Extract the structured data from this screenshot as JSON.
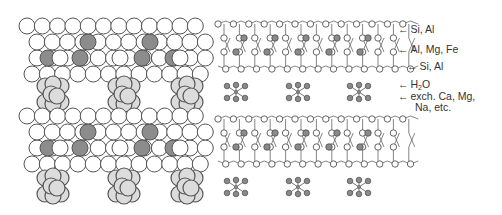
{
  "diagram": {
    "colors": {
      "outline": "#555555",
      "white_atom": "#ffffff",
      "dark_atom": "#8c8c8c",
      "cation_cluster": "#dcdcdc",
      "small_atom_dark": "#8a8a8a",
      "bond": "#666666",
      "text": "#333333"
    },
    "left_panel": {
      "name": "space-filling model",
      "layers": 2,
      "clusters_per_interlayer": 3
    },
    "right_panel": {
      "name": "ball-and-stick model",
      "layers": 2,
      "interlayer_clusters": 3
    },
    "labels": [
      {
        "id": "tet-top",
        "text": "Si, Al"
      },
      {
        "id": "oct",
        "text": "Al, Mg, Fe"
      },
      {
        "id": "tet-bottom",
        "text": "Si, Al"
      },
      {
        "id": "water",
        "text_main": "H",
        "text_sub": "2",
        "text_tail": "O"
      },
      {
        "id": "exch",
        "text_line1": "exch. Ca, Mg,",
        "text_line2": "Na, etc."
      }
    ]
  }
}
